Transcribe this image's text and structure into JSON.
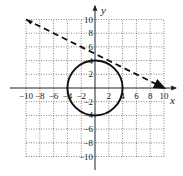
{
  "chart_data": {
    "type": "line",
    "title": "",
    "xlabel": "x",
    "ylabel": "y",
    "xlim": [
      -10,
      10
    ],
    "ylim": [
      -10,
      10
    ],
    "grid": true,
    "grid_style": "dotted",
    "x_ticks": [
      -10,
      -8,
      -6,
      -4,
      -2,
      2,
      4,
      6,
      8,
      10
    ],
    "y_ticks": [
      -10,
      -8,
      -6,
      -4,
      -2,
      2,
      4,
      6,
      8,
      10
    ],
    "x_tick_labels": [
      "-10",
      "-8",
      "-6",
      "-4",
      "-2",
      "2",
      "4",
      "6",
      "8",
      "10"
    ],
    "y_tick_labels": [
      "-10",
      "-8",
      "-6",
      "-4",
      "-2",
      "2",
      "4",
      "6",
      "8",
      "10"
    ],
    "series": [
      {
        "name": "circle",
        "style": "solid",
        "equation": "x^2 + y^2 = 16",
        "center": [
          0,
          0
        ],
        "radius": 4
      },
      {
        "name": "line",
        "style": "dashed",
        "equation": "y = -x/2 + 5",
        "x": [
          -10,
          10
        ],
        "y": [
          10,
          0
        ],
        "arrows": "both"
      }
    ]
  },
  "labels": {
    "x_axis": "x",
    "y_axis": "y"
  },
  "colors": {
    "curve": "#111111",
    "grid": "#555555",
    "axis": "#222222"
  }
}
